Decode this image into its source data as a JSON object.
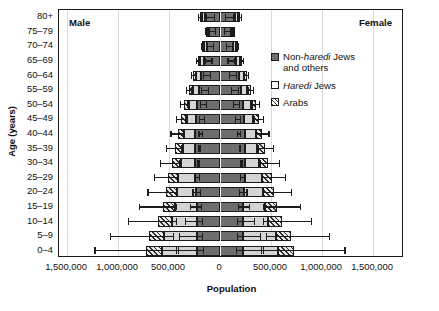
{
  "labels": {
    "male": "Male",
    "female": "Female",
    "ylabel": "Age (years)",
    "xlabel": "Population"
  },
  "legend": [
    {
      "id": "non-haredi",
      "line1": "Non-",
      "italic": "haredi",
      "line1b": " Jews",
      "line2": "and others",
      "color": "#6e6e6e",
      "pattern": "solid"
    },
    {
      "id": "haredi",
      "italic": "Haredi",
      "line1b": " Jews",
      "color": "#d5d5d5",
      "pattern": "solid"
    },
    {
      "id": "arabs",
      "line1": "Arabs",
      "color": "#e8e8e8",
      "pattern": "hatch"
    }
  ],
  "xticks": [
    {
      "value": -1500000,
      "label": "1,500,000"
    },
    {
      "value": -1000000,
      "label": "1,000,000"
    },
    {
      "value": -500000,
      "label": "500,000"
    },
    {
      "value": 0,
      "label": "0"
    },
    {
      "value": 500000,
      "label": "500,000"
    },
    {
      "value": 1000000,
      "label": "1,000,000"
    },
    {
      "value": 1500000,
      "label": "1,500,000"
    }
  ],
  "chart_data": {
    "type": "bar",
    "subtype": "population-pyramid-stacked-horizontal",
    "title": "",
    "xlabel": "Population",
    "ylabel": "Age (years)",
    "xlim": [
      -1500000,
      1500000
    ],
    "xtick_values": [
      -1500000,
      -1000000,
      -500000,
      0,
      500000,
      1000000,
      1500000
    ],
    "grid": true,
    "legend_position": "inside-upper-right",
    "categories": [
      "0-4",
      "5-9",
      "10-14",
      "15-19",
      "20-24",
      "25-29",
      "30-34",
      "35-39",
      "40-44",
      "45-49",
      "50-54",
      "55-59",
      "60-64",
      "65-69",
      "70-74",
      "75-79",
      "80+"
    ],
    "stack_order_from_center": [
      "Non-haredi Jews and others",
      "Haredi Jews",
      "Arabs"
    ],
    "sides": [
      "Male",
      "Female"
    ],
    "series": [
      {
        "name": "Non-haredi Jews and others",
        "color": "#6e6e6e",
        "male": [
          225000,
          225000,
          225000,
          225000,
          235000,
          245000,
          245000,
          245000,
          245000,
          235000,
          230000,
          205000,
          185000,
          160000,
          130000,
          105000,
          150000
        ],
        "female": [
          225000,
          225000,
          225000,
          225000,
          235000,
          245000,
          245000,
          245000,
          245000,
          235000,
          230000,
          205000,
          185000,
          160000,
          130000,
          105000,
          150000
        ]
      },
      {
        "name": "Haredi Jews",
        "color": "#d5d5d5",
        "male": [
          345000,
          320000,
          250000,
          215000,
          185000,
          165000,
          140000,
          120000,
          105000,
          90000,
          75000,
          60000,
          48000,
          36000,
          26000,
          18000,
          22000
        ],
        "female": [
          345000,
          320000,
          250000,
          215000,
          185000,
          165000,
          140000,
          120000,
          105000,
          90000,
          75000,
          60000,
          48000,
          36000,
          26000,
          18000,
          22000
        ]
      },
      {
        "name": "Arabs",
        "color": "#e8e8e8",
        "pattern": "hatch",
        "male": [
          155000,
          150000,
          130000,
          120000,
          105000,
          95000,
          85000,
          75000,
          65000,
          55000,
          45000,
          36000,
          28000,
          22000,
          16000,
          12000,
          22000
        ],
        "female": [
          155000,
          150000,
          130000,
          120000,
          105000,
          95000,
          85000,
          75000,
          65000,
          55000,
          45000,
          36000,
          28000,
          22000,
          16000,
          12000,
          22000
        ]
      }
    ],
    "totals": {
      "male": [
        725000,
        695000,
        605000,
        560000,
        525000,
        505000,
        470000,
        440000,
        415000,
        380000,
        350000,
        301000,
        261000,
        218000,
        172000,
        135000,
        194000
      ],
      "female": [
        725000,
        695000,
        605000,
        560000,
        525000,
        505000,
        470000,
        440000,
        415000,
        380000,
        350000,
        301000,
        261000,
        218000,
        172000,
        135000,
        194000
      ]
    },
    "error_bars": {
      "description": "Two error bars per side: one on the Non-haredi/Haredi boundary (inner) and one on the outer total.",
      "inner_lower": {
        "male": [
          160000,
          175000,
          175000,
          180000,
          190000,
          200000,
          205000,
          205000,
          205000,
          200000,
          195000,
          180000,
          165000,
          145000,
          120000,
          100000,
          135000
        ],
        "female": [
          160000,
          175000,
          175000,
          180000,
          190000,
          200000,
          205000,
          205000,
          205000,
          200000,
          195000,
          180000,
          165000,
          145000,
          120000,
          100000,
          135000
        ]
      },
      "inner_upper": {
        "male": [
          430000,
          400000,
          335000,
          290000,
          265000,
          240000,
          215000,
          195000,
          175000,
          155000,
          135000,
          115000,
          95000,
          78000,
          60000,
          45000,
          52000
        ],
        "female": [
          430000,
          400000,
          335000,
          290000,
          265000,
          240000,
          215000,
          195000,
          175000,
          155000,
          135000,
          115000,
          95000,
          78000,
          60000,
          45000,
          52000
        ]
      },
      "outer_lower": {
        "male": [
          410000,
          455000,
          430000,
          425000,
          415000,
          410000,
          395000,
          380000,
          360000,
          335000,
          315000,
          275000,
          240000,
          205000,
          162000,
          128000,
          180000
        ],
        "female": [
          410000,
          455000,
          430000,
          425000,
          415000,
          410000,
          395000,
          380000,
          360000,
          335000,
          315000,
          275000,
          240000,
          205000,
          162000,
          128000,
          180000
        ]
      },
      "outer_upper": {
        "male": [
          1225000,
          1075000,
          900000,
          790000,
          705000,
          645000,
          580000,
          525000,
          480000,
          430000,
          385000,
          330000,
          282000,
          232000,
          182000,
          142000,
          212000
        ],
        "female": [
          1225000,
          1075000,
          900000,
          790000,
          705000,
          645000,
          580000,
          525000,
          480000,
          430000,
          385000,
          330000,
          282000,
          232000,
          182000,
          142000,
          212000
        ]
      }
    }
  }
}
